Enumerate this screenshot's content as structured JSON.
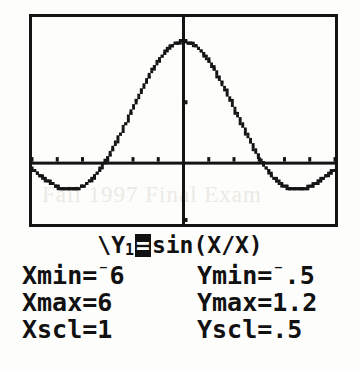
{
  "device": {
    "screen_label": "graphing-calculator-screen",
    "background_color": "#fdfdfb",
    "ink_color": "#141414"
  },
  "watermark": {
    "text": "Fall 1997 Final Exam"
  },
  "equation": {
    "prefix": "\\Y",
    "index": "1",
    "equals": "=",
    "body": "sin(X/X)",
    "full_text": "\\Y1=sin(X/X)"
  },
  "window_settings": {
    "rows": [
      {
        "x_label": "Xmin=",
        "x_negative": true,
        "x_value": "6",
        "y_label": "Ymin=",
        "y_negative": true,
        "y_value": ".5"
      },
      {
        "x_label": "Xmax=",
        "x_negative": false,
        "x_value": "6",
        "y_label": "Ymax=",
        "y_negative": false,
        "y_value": "1.2"
      },
      {
        "x_label": "Xscl=",
        "x_negative": false,
        "x_value": "1",
        "y_label": "Yscl=",
        "y_negative": false,
        "y_value": ".5"
      }
    ]
  },
  "chart_data": {
    "type": "line",
    "title": "",
    "xlabel": "X",
    "ylabel": "Y",
    "xlim": [
      -6,
      6
    ],
    "ylim": [
      -0.5,
      1.2
    ],
    "xscl": 1,
    "yscl": 0.5,
    "grid": false,
    "legend": null,
    "axes": {
      "x_axis_at_y": 0,
      "y_axis_at_x": 0,
      "x_ticks": [
        -6,
        -5,
        -4,
        -3,
        -2,
        -1,
        0,
        1,
        2,
        3,
        4,
        5,
        6
      ],
      "y_ticks": [
        -0.5,
        0,
        0.5,
        1.0
      ]
    },
    "series": [
      {
        "name": "Y1 = sin(X)/X",
        "style": "dotted-pixels",
        "x": [
          -6.0,
          -5.8,
          -5.6,
          -5.4,
          -5.2,
          -5.0,
          -4.8,
          -4.6,
          -4.4,
          -4.2,
          -4.0,
          -3.8,
          -3.6,
          -3.4,
          -3.2,
          -3.0,
          -2.8,
          -2.6,
          -2.4,
          -2.2,
          -2.0,
          -1.8,
          -1.6,
          -1.4,
          -1.2,
          -1.0,
          -0.8,
          -0.6,
          -0.4,
          -0.2,
          0.0,
          0.2,
          0.4,
          0.6,
          0.8,
          1.0,
          1.2,
          1.4,
          1.6,
          1.8,
          2.0,
          2.2,
          2.4,
          2.6,
          2.8,
          3.0,
          3.2,
          3.4,
          3.6,
          3.8,
          4.0,
          4.2,
          4.4,
          4.6,
          4.8,
          5.0,
          5.2,
          5.4,
          5.6,
          5.8,
          6.0
        ],
        "y": [
          -0.0466,
          -0.0779,
          -0.1128,
          -0.1462,
          -0.1716,
          -0.1918,
          -0.2059,
          -0.2131,
          -0.2172,
          -0.2095,
          -0.1892,
          -0.1589,
          -0.1224,
          -0.0779,
          -0.0181,
          0.047,
          0.1199,
          0.197,
          0.2805,
          0.3668,
          0.4546,
          0.5417,
          0.6253,
          0.7039,
          0.7767,
          0.8415,
          0.8967,
          0.9411,
          0.9735,
          0.9933,
          1.0,
          0.9933,
          0.9735,
          0.9411,
          0.8967,
          0.8415,
          0.7767,
          0.7039,
          0.6253,
          0.5417,
          0.4546,
          0.3668,
          0.2805,
          0.197,
          0.1199,
          0.047,
          -0.0181,
          -0.0779,
          -0.1224,
          -0.1589,
          -0.1892,
          -0.2095,
          -0.2172,
          -0.2131,
          -0.2059,
          -0.1918,
          -0.1716,
          -0.1462,
          -0.1128,
          -0.0779,
          -0.0466
        ]
      }
    ],
    "annotations": [
      {
        "text": "peak at x=0, y=1",
        "x": 0,
        "y": 1.0
      }
    ]
  }
}
